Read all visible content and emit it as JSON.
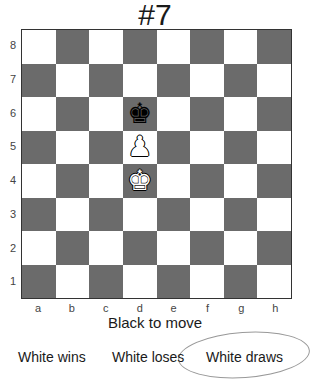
{
  "puzzle": {
    "title": "#7",
    "status": "Black to move"
  },
  "board": {
    "light_color": "#ffffff",
    "dark_color": "#6b6b6b",
    "files": [
      "a",
      "b",
      "c",
      "d",
      "e",
      "f",
      "g",
      "h"
    ],
    "ranks": [
      "8",
      "7",
      "6",
      "5",
      "4",
      "3",
      "2",
      "1"
    ],
    "pieces": [
      {
        "square": "d6",
        "type": "king",
        "color": "black",
        "glyph": "♚"
      },
      {
        "square": "d5",
        "type": "pawn",
        "color": "white",
        "glyph": "♟"
      },
      {
        "square": "d4",
        "type": "king",
        "color": "white",
        "glyph": "♚"
      }
    ]
  },
  "answers": [
    {
      "label": "White wins",
      "selected": false
    },
    {
      "label": "White loses",
      "selected": false
    },
    {
      "label": "White draws",
      "selected": true
    }
  ]
}
